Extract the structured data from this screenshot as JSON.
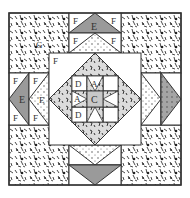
{
  "diagram": {
    "type": "quilt-block-diagram",
    "colors": {
      "outline": "#333333",
      "dark_gray": "#9a9a9a",
      "light_gray": "#cfcfcf",
      "white": "#ffffff",
      "speckle": "#222222"
    },
    "labels": {
      "corner": "G",
      "goose_large": "E",
      "goose_background": "F",
      "center_square": "C",
      "star_point": "A",
      "star_corner": "D"
    }
  }
}
